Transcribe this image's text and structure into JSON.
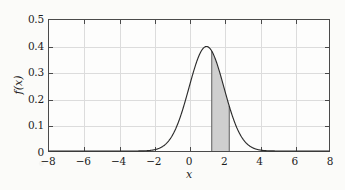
{
  "figure": {
    "background_color": "#fbfbf9",
    "plot_background_color": "#fdfdfc",
    "axis_color": "#4a4a4a",
    "grid_color": "#dcdcdc",
    "curve_color": "#2b2b2b",
    "shade_fill_color": "#cfcfcf",
    "shade_edge_color": "#5a5a5a"
  },
  "chart_data": {
    "type": "line",
    "title": "",
    "subtitle": "",
    "xlabel": "x",
    "ylabel": "f(x)",
    "xlim": [
      -8,
      8
    ],
    "ylim": [
      0,
      0.5
    ],
    "xticks": [
      -8,
      -6,
      -4,
      -2,
      0,
      2,
      4,
      6,
      8
    ],
    "xtick_labels": [
      "−8",
      "−6",
      "−4",
      "−2",
      "0",
      "2",
      "4",
      "6",
      "8"
    ],
    "yticks": [
      0,
      0.1,
      0.2,
      0.3,
      0.4,
      0.5
    ],
    "ytick_labels": [
      "0",
      "0.1",
      "0.2",
      "0.3",
      "0.4",
      "0.5"
    ],
    "grid": true,
    "legend": null,
    "legend_position": "none",
    "annotations": [],
    "series": [
      {
        "name": "f(x)",
        "kind": "normal-pdf",
        "mean": 1.0,
        "stddev": 1.0,
        "peak_x": 1.0,
        "peak_y": 0.3989,
        "x": [
          -8.0,
          -7.5,
          -7.0,
          -6.5,
          -6.0,
          -5.5,
          -5.0,
          -4.5,
          -4.0,
          -3.5,
          -3.0,
          -2.5,
          -2.0,
          -1.5,
          -1.0,
          -0.5,
          0.0,
          0.25,
          0.5,
          0.75,
          1.0,
          1.25,
          1.5,
          1.75,
          2.0,
          2.25,
          2.5,
          3.0,
          3.5,
          4.0,
          4.5,
          5.0,
          5.5,
          6.0,
          6.5,
          7.0,
          7.5,
          8.0
        ],
        "y": [
          0.0,
          0.0,
          0.0,
          0.0,
          0.0,
          0.0,
          0.0,
          0.0,
          0.0001,
          0.0004,
          0.0013,
          0.0044,
          0.0044,
          0.0175,
          0.054,
          0.1295,
          0.242,
          0.3011,
          0.3521,
          0.3867,
          0.3989,
          0.3867,
          0.3521,
          0.3011,
          0.242,
          0.1826,
          0.1295,
          0.054,
          0.0175,
          0.0044,
          0.0009,
          0.0001,
          0.0,
          0.0,
          0.0,
          0.0,
          0.0,
          0.0
        ]
      }
    ],
    "shaded_region": {
      "label": "",
      "x_start": 1.3,
      "x_end": 2.3,
      "y_start": 0.0,
      "fill": "#cfcfcf",
      "description": "area under the curve between x = 1.3 and x = 2.3"
    }
  }
}
